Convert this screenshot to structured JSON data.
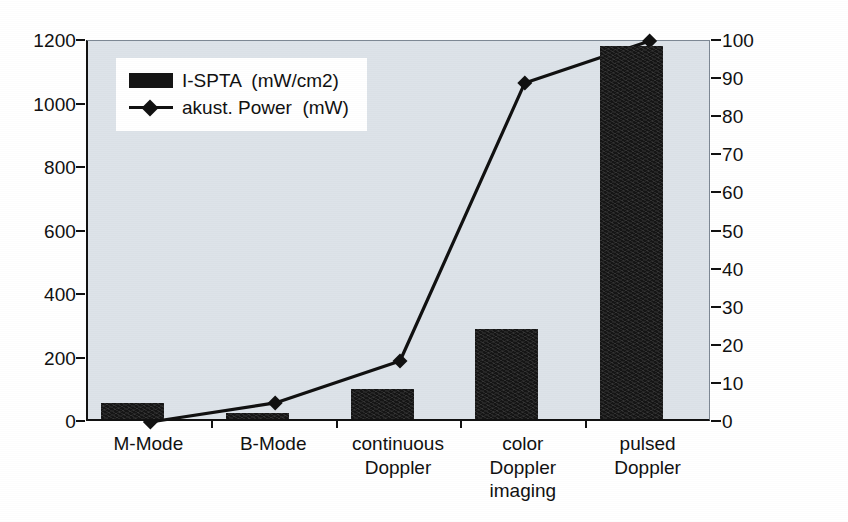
{
  "chart_data": {
    "type": "bar",
    "title": "",
    "subtitle": "",
    "xlabel": "",
    "ylabel": "",
    "categories": [
      "M-Mode",
      "B-Mode",
      "continuous\nDoppler",
      "color\nDoppler\nimaging",
      "pulsed\nDoppler"
    ],
    "grid": false,
    "legend_position": "top-left",
    "axes": {
      "left": {
        "label": "I-SPTA  (mW/cm2)",
        "min": 0,
        "max": 1200,
        "step": 200,
        "ticks": [
          0,
          200,
          400,
          600,
          800,
          1000,
          1200
        ],
        "tick_labels": [
          "0",
          "200",
          "400",
          "600",
          "800",
          "1000",
          "1200"
        ]
      },
      "right": {
        "label": "akust. Power  (mW)",
        "min": 0,
        "max": 100,
        "step": 10,
        "ticks": [
          0,
          10,
          20,
          30,
          40,
          50,
          60,
          70,
          80,
          90,
          100
        ],
        "tick_labels": [
          "0",
          "10",
          "20",
          "30",
          "40",
          "50",
          "60",
          "70",
          "80",
          "90",
          "100"
        ]
      }
    },
    "series": [
      {
        "name": "I-SPTA  (mW/cm2)",
        "type": "bar",
        "axis": "left",
        "color": "#151515",
        "values": [
          50,
          20,
          95,
          285,
          1175
        ]
      },
      {
        "name": "akust. Power  (mW)",
        "type": "line",
        "axis": "right",
        "color": "#111111",
        "marker": "diamond",
        "values": [
          0,
          5,
          16,
          89,
          100
        ]
      }
    ]
  },
  "legend": {
    "items": [
      {
        "label": "I-SPTA  (mW/cm2)",
        "marker": "bar-swatch"
      },
      {
        "label": "akust. Power  (mW)",
        "marker": "line-diamond"
      }
    ]
  },
  "colors": {
    "plot_background": "#dde3e9",
    "page_background": "#ffffff",
    "bar": "#151515",
    "line": "#111111",
    "axis": "#111111",
    "text": "#111111"
  }
}
